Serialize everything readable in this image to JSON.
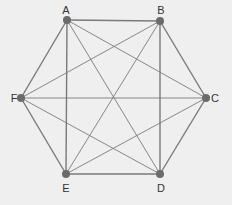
{
  "diagram": {
    "type": "complete-graph",
    "name": "K6",
    "background": "#efefef",
    "edge_color": "#7a7a7a",
    "node_color": "#6b6b6b",
    "nodes": [
      {
        "id": "A",
        "label": "A",
        "x": 67,
        "y": 20,
        "lx": 66,
        "ly": 14
      },
      {
        "id": "B",
        "label": "B",
        "x": 160,
        "y": 21,
        "lx": 161,
        "ly": 14
      },
      {
        "id": "C",
        "label": "C",
        "x": 206,
        "y": 98,
        "lx": 215,
        "ly": 102
      },
      {
        "id": "D",
        "label": "D",
        "x": 160,
        "y": 174,
        "lx": 161,
        "ly": 192
      },
      {
        "id": "E",
        "label": "E",
        "x": 66,
        "y": 174,
        "lx": 66,
        "ly": 192
      },
      {
        "id": "F",
        "label": "F",
        "x": 21,
        "y": 98,
        "lx": 14,
        "ly": 102
      }
    ],
    "edges": [
      {
        "from": 0,
        "to": 1,
        "w": 1.4
      },
      {
        "from": 1,
        "to": 2,
        "w": 1.4
      },
      {
        "from": 2,
        "to": 3,
        "w": 1.4
      },
      {
        "from": 3,
        "to": 4,
        "w": 1.4
      },
      {
        "from": 4,
        "to": 5,
        "w": 1.4
      },
      {
        "from": 5,
        "to": 0,
        "w": 1.4
      },
      {
        "from": 0,
        "to": 4,
        "w": 1.4
      },
      {
        "from": 1,
        "to": 3,
        "w": 1.4
      },
      {
        "from": 0,
        "to": 2,
        "w": 0.9
      },
      {
        "from": 0,
        "to": 3,
        "w": 0.9
      },
      {
        "from": 1,
        "to": 5,
        "w": 0.9
      },
      {
        "from": 1,
        "to": 4,
        "w": 0.9
      },
      {
        "from": 2,
        "to": 5,
        "w": 0.9
      },
      {
        "from": 2,
        "to": 4,
        "w": 0.9
      },
      {
        "from": 3,
        "to": 5,
        "w": 0.9
      }
    ]
  }
}
